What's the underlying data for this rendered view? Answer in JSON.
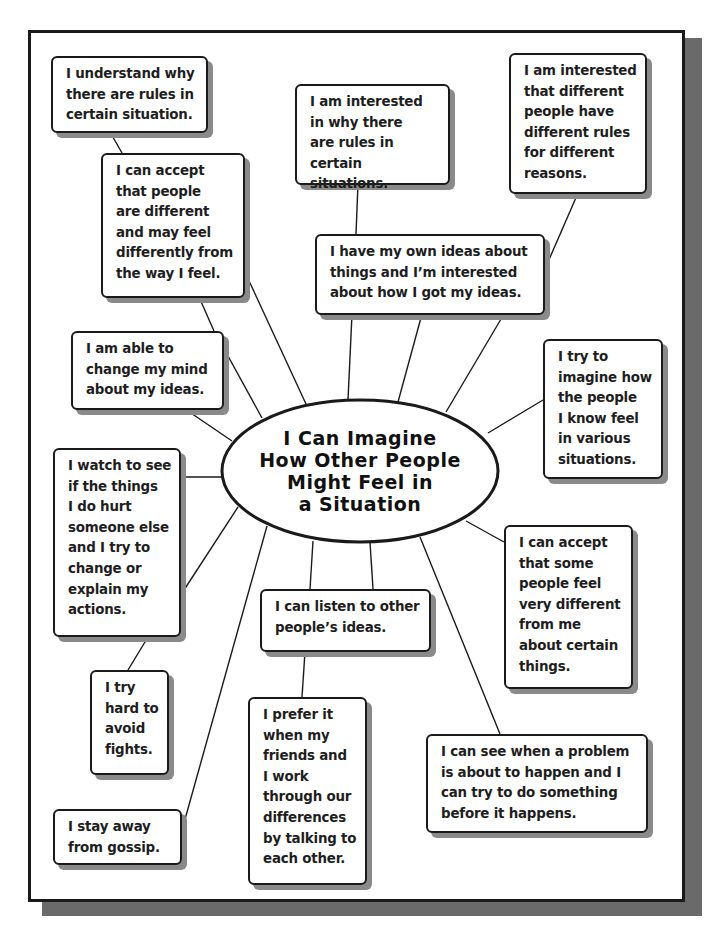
{
  "center": {
    "title": "I Can Imagine\nHow Other People\nMight Feel in\na Situation",
    "cx": 360,
    "cy": 471,
    "rx": 138,
    "ry": 71
  },
  "colors": {
    "ink": "#1a1a1a",
    "paper": "#ffffff",
    "shadow": "#8a8a8a",
    "frame_shadow": "#6a6a6a"
  },
  "boxes": [
    {
      "id": "understand-rules",
      "text": "I understand why\nthere are rules in\ncertain situation.",
      "x": 51,
      "y": 56,
      "w": 157,
      "h": 77
    },
    {
      "id": "accept-people-different",
      "text": "I can accept\nthat people\nare different\nand may feel\ndifferently from\nthe way I feel.",
      "x": 101,
      "y": 153,
      "w": 144,
      "h": 145
    },
    {
      "id": "interested-why-rules",
      "text": "I am interested\nin why there\nare rules in\ncertain situations.",
      "x": 295,
      "y": 84,
      "w": 155,
      "h": 101
    },
    {
      "id": "interested-different-rules",
      "text": "I am interested\nthat different\npeople have\ndifferent rules\nfor different\nreasons.",
      "x": 509,
      "y": 53,
      "w": 138,
      "h": 141
    },
    {
      "id": "own-ideas",
      "text": "I have my own ideas about\nthings and I’m interested\nabout how I got my ideas.",
      "x": 315,
      "y": 234,
      "w": 230,
      "h": 81
    },
    {
      "id": "change-mind",
      "text": "I am able to\nchange my mind\nabout my ideas.",
      "x": 71,
      "y": 331,
      "w": 153,
      "h": 79
    },
    {
      "id": "imagine-how-people-feel",
      "text": "I try to\nimagine how\nthe people\nI know feel\nin various\nsituations.",
      "x": 543,
      "y": 339,
      "w": 120,
      "h": 140
    },
    {
      "id": "watch-hurt",
      "text": "I watch to see\nif the things\nI do hurt\nsomeone else\nand I try to\nchange or\nexplain my\nactions.",
      "x": 53,
      "y": 448,
      "w": 128,
      "h": 189
    },
    {
      "id": "accept-some-people",
      "text": "I can accept\nthat some\npeople feel\nvery different\nfrom me\nabout certain\nthings.",
      "x": 504,
      "y": 525,
      "w": 129,
      "h": 164
    },
    {
      "id": "listen-ideas",
      "text": "I can listen to other\npeople’s ideas.",
      "x": 260,
      "y": 589,
      "w": 171,
      "h": 63
    },
    {
      "id": "avoid-fights",
      "text": "I try\nhard to\navoid\nfights.",
      "x": 90,
      "y": 670,
      "w": 79,
      "h": 105
    },
    {
      "id": "prefer-talking",
      "text": "I prefer it\nwhen my\nfriends and\nI work\nthrough our\ndifferences\nby talking to\neach other.",
      "x": 248,
      "y": 697,
      "w": 119,
      "h": 188
    },
    {
      "id": "see-problem",
      "text": "I can see when a problem\nis about to happen and I\ncan try to do something\nbefore it happens.",
      "x": 426,
      "y": 734,
      "w": 222,
      "h": 99
    },
    {
      "id": "stay-away-gossip",
      "text": "I stay away\nfrom gossip.",
      "x": 53,
      "y": 809,
      "w": 129,
      "h": 56
    }
  ],
  "connectors": [
    [
      110,
      132,
      122,
      153
    ],
    [
      199,
      297,
      214,
      331
    ],
    [
      244,
      270,
      306,
      404
    ],
    [
      358,
      184,
      356,
      234
    ],
    [
      578,
      193,
      548,
      262
    ],
    [
      352,
      314,
      348,
      400
    ],
    [
      422,
      314,
      398,
      402
    ],
    [
      504,
      314,
      446,
      412
    ],
    [
      228,
      356,
      262,
      418
    ],
    [
      185,
      409,
      232,
      441
    ],
    [
      543,
      400,
      488,
      433
    ],
    [
      181,
      477,
      222,
      477
    ],
    [
      184,
      590,
      238,
      507
    ],
    [
      148,
      637,
      128,
      670
    ],
    [
      267,
      526,
      182,
      830
    ],
    [
      313,
      541,
      310,
      589
    ],
    [
      370,
      542,
      373,
      589
    ],
    [
      420,
      537,
      500,
      734
    ],
    [
      466,
      521,
      504,
      542
    ],
    [
      305,
      652,
      302,
      697
    ]
  ]
}
